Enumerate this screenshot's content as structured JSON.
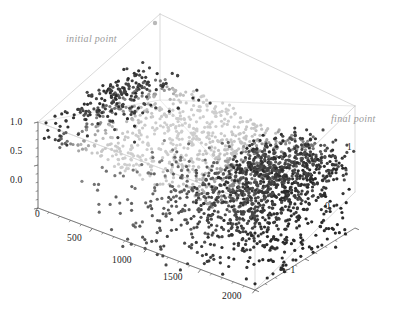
{
  "figure": {
    "kind": "3d-scatter-plot",
    "background": "#ffffff",
    "frame_color": "#c8c8c8",
    "tick_color": "#555555",
    "label_color": "#1a1a1a",
    "annotation_color": "#9a9a9a"
  },
  "annotations": [
    {
      "name": "initial-point",
      "text": "initial point",
      "x": 66,
      "y": 33,
      "marker_x": 155,
      "marker_y": 23,
      "marker_color": "#b9b9b9"
    },
    {
      "name": "final-point",
      "text": "final point",
      "x": 331,
      "y": 113,
      "marker_x": 0,
      "marker_y": 0,
      "marker_color": "#6f6f6f"
    }
  ],
  "axes": {
    "x": {
      "name": "x-axis",
      "ticks": [
        "0",
        "500",
        "1000",
        "1500",
        "2000"
      ],
      "values": [
        0,
        500,
        1000,
        1500,
        2000
      ],
      "range": [
        0,
        2000
      ],
      "minor_per_major": 5,
      "label_positions": [
        {
          "x": 35,
          "y": 209
        },
        {
          "x": 67,
          "y": 233
        },
        {
          "x": 112,
          "y": 255
        },
        {
          "x": 163,
          "y": 272
        },
        {
          "x": 222,
          "y": 291
        }
      ]
    },
    "y": {
      "name": "y-axis",
      "ticks": [
        "1",
        "0",
        "-1"
      ],
      "values": [
        1,
        0,
        -1
      ],
      "range": [
        -1,
        1
      ],
      "minor_per_major": 5,
      "label_positions": [
        {
          "x": 347,
          "y": 142
        },
        {
          "x": 325,
          "y": 201
        },
        {
          "x": 285,
          "y": 265
        }
      ]
    },
    "z": {
      "name": "z-axis",
      "ticks": [
        "1.0",
        "0.5",
        "0.0"
      ],
      "values": [
        1.0,
        0.5,
        0.0
      ],
      "range": [
        0.0,
        1.0
      ],
      "minor_per_major": 5,
      "label_positions": [
        {
          "x": 10,
          "y": 117
        },
        {
          "x": 10,
          "y": 146
        },
        {
          "x": 10,
          "y": 175
        }
      ]
    }
  },
  "chart_data": {
    "type": "scatter",
    "title": "",
    "xlabel": "",
    "ylabel": "",
    "zlabel": "",
    "projection": "3d",
    "xlim": [
      0,
      2000
    ],
    "ylim": [
      -1,
      1
    ],
    "zlim": [
      0,
      1
    ],
    "xticks": [
      0,
      500,
      1000,
      1500,
      2000
    ],
    "yticks": [
      -1,
      0,
      1
    ],
    "zticks": [
      0.0,
      0.5,
      1.0
    ],
    "grid": false,
    "legend": "none",
    "point_count": 2000,
    "point_radius_px": 1.6,
    "color_scale": "grayscale",
    "color_note": "points shaded from light gray (#d8d8d8) through mid gray to near-black (#2a2a2a); lightest in the mid-x band, darkest at low-x edge and at high-x final-point cluster",
    "annotation_texts": [
      "initial point",
      "final point"
    ],
    "projection_matrix": {
      "origin_px": [
        38,
        208
      ],
      "x_axis_px": [
        217,
        82
      ],
      "y_axis_px": [
        100,
        -62
      ],
      "z_axis_px": [
        0,
        -86
      ]
    },
    "clusters": [
      {
        "name": "upper-sheet",
        "x_span": [
          0,
          2000
        ],
        "y_span": [
          -1,
          1
        ],
        "z_span": [
          0.55,
          1.0
        ],
        "shade": "light-to-mid",
        "density": "high"
      },
      {
        "name": "low-x-dark-edge",
        "x_span": [
          0,
          400
        ],
        "y_span": [
          -0.3,
          1
        ],
        "z_span": [
          0.6,
          1.0
        ],
        "shade": "dark",
        "density": "medium"
      },
      {
        "name": "final-cluster",
        "x_span": [
          1500,
          2000
        ],
        "y_span": [
          -1,
          1
        ],
        "z_span": [
          0.4,
          1.0
        ],
        "shade": "dark",
        "density": "very-high"
      },
      {
        "name": "lower-diffuse",
        "x_span": [
          200,
          2000
        ],
        "y_span": [
          -1,
          1
        ],
        "z_span": [
          0.0,
          0.5
        ],
        "shade": "mid-to-dark",
        "density": "low"
      }
    ]
  }
}
